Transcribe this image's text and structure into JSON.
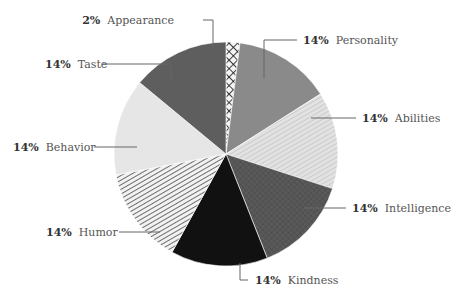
{
  "chart_data": {
    "type": "pie",
    "title": "",
    "start": "top",
    "direction": "clockwise",
    "slices": [
      {
        "label": "Appearance",
        "value": 2,
        "pct_label": "2%",
        "fill": "crosshatch",
        "color": "#222222"
      },
      {
        "label": "Personality",
        "value": 14,
        "pct_label": "14%",
        "fill": "solid",
        "color": "#8a8a8a"
      },
      {
        "label": "Abilities",
        "value": 14,
        "pct_label": "14%",
        "fill": "diag-stripe",
        "color": "#d4d4d4"
      },
      {
        "label": "Intelligence",
        "value": 14,
        "pct_label": "14%",
        "fill": "grid",
        "color": "#555555"
      },
      {
        "label": "Kindness",
        "value": 14,
        "pct_label": "14%",
        "fill": "solid",
        "color": "#111111"
      },
      {
        "label": "Humor",
        "value": 14,
        "pct_label": "14%",
        "fill": "stripe",
        "color": "#777777"
      },
      {
        "label": "Behavior",
        "value": 14,
        "pct_label": "14%",
        "fill": "solid",
        "color": "#e6e6e6"
      },
      {
        "label": "Taste",
        "value": 14,
        "pct_label": "14%",
        "fill": "solid",
        "color": "#5e5e5e"
      }
    ]
  }
}
